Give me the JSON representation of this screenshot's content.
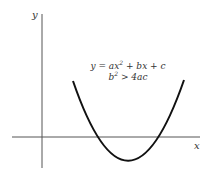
{
  "diagram": {
    "axes": {
      "x_label": "x",
      "y_label": "y",
      "color": "#555555"
    },
    "curve": {
      "type": "parabola",
      "description": "upward-opening parabola crossing the x-axis at two points",
      "color": "#111111"
    },
    "equation": {
      "line1_prefix": "y = ax",
      "line1_exp": "2",
      "line1_suffix": " + bx + c",
      "line2_base": "b",
      "line2_exp": "2",
      "line2_suffix": " > 4ac"
    }
  }
}
